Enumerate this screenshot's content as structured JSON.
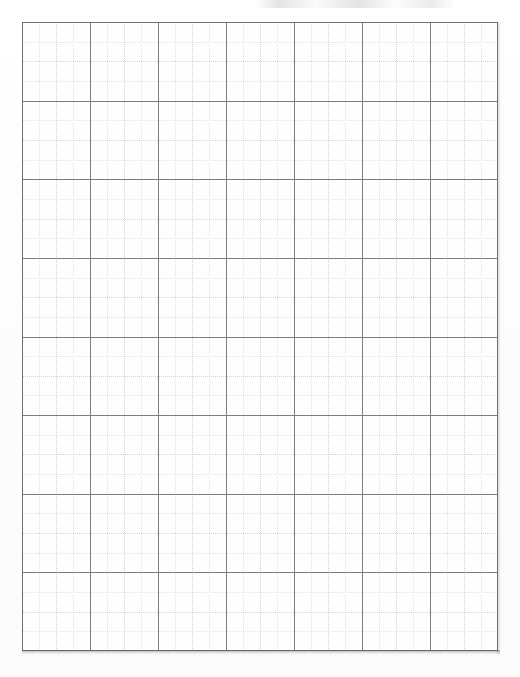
{
  "document": {
    "kind": "graph-paper-sheet",
    "title": "Blank Graph Paper"
  },
  "grid": {
    "origin_x": 22,
    "origin_y": 22,
    "width": 476,
    "height": 629,
    "major_columns": 7,
    "major_rows": 8,
    "minor_per_major_x": 4,
    "minor_per_major_y": 4,
    "major_cell_width": 68.0,
    "major_cell_height": 78.6,
    "minor_cell_width": 17.0,
    "minor_cell_height": 19.65,
    "major_line_color": "#7d7d7d",
    "minor_line_color": "#cfcfcf",
    "minor_line_color_faint": "#e2e2e2",
    "frame_color": "#6f6f6f",
    "background_color": "#fefefe",
    "minor_line_style": "dotted",
    "major_line_style": "solid"
  },
  "page": {
    "width": 520,
    "height": 677,
    "background_color": "#ffffff",
    "paper_tint": "#fbfbfb"
  },
  "artifacts": {
    "bottom_shadow_color": "#5a5a5a",
    "right_shadow_color": "#6e6e6e",
    "top_smudge_color": "#cdcdcd"
  }
}
